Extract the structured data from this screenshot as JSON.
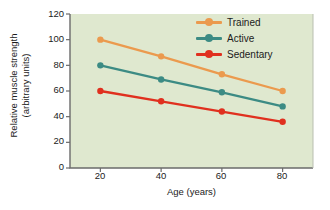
{
  "chart_data": {
    "type": "line",
    "title": "",
    "subtitle": "",
    "xlabel": "Age (years)",
    "ylabel": "Relative muscle strength (arbitrary units)",
    "ylabel_line1": "Relative muscle strength",
    "ylabel_line2": "(arbitrary units)",
    "x": [
      20,
      40,
      60,
      80
    ],
    "xticklabels": [
      "20",
      "40",
      "60",
      "80"
    ],
    "yticklabels": [
      "0",
      "20",
      "40",
      "60",
      "80",
      "100",
      "120"
    ],
    "yticks": [
      0,
      20,
      40,
      60,
      80,
      100,
      120
    ],
    "xlim": [
      10,
      90
    ],
    "ylim": [
      0,
      120
    ],
    "grid": false,
    "legend_position": "top-right",
    "series": [
      {
        "name": "Trained",
        "color": "#eb9a4e",
        "values": [
          100,
          87,
          73,
          60
        ]
      },
      {
        "name": "Active",
        "color": "#3c8b84",
        "values": [
          80,
          69,
          59,
          48
        ]
      },
      {
        "name": "Sedentary",
        "color": "#e0301f",
        "values": [
          60,
          52,
          44,
          36
        ]
      }
    ]
  },
  "figure": {
    "plot_background": "#dfe8cf",
    "page_background": "#ffffff",
    "frame_color": "#6b6b6b",
    "text_color": "#1b1b1b"
  },
  "legend": {
    "items": [
      {
        "label": "Trained"
      },
      {
        "label": "Active"
      },
      {
        "label": "Sedentary"
      }
    ]
  }
}
